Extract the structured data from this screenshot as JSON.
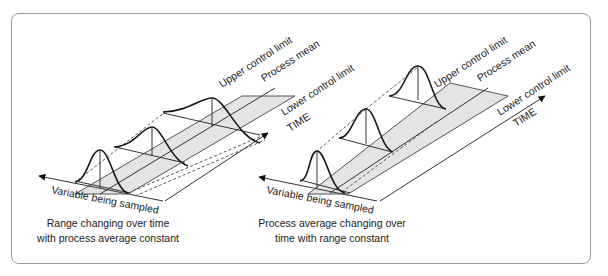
{
  "figure": {
    "left_panel": {
      "labels": {
        "upper": "Upper control limit",
        "mean": "Process mean",
        "lower": "Lower control limit",
        "time": "TIME",
        "variable": "Variable being sampled"
      },
      "caption_line1": "Range changing over time",
      "caption_line2": "with process average constant"
    },
    "right_panel": {
      "labels": {
        "upper": "Upper control limit",
        "mean": "Process mean",
        "lower": "Lower control limit",
        "time": "TIME",
        "variable": "Variable being sampled"
      },
      "caption_line1": "Process average changing over",
      "caption_line2": "time with range constant"
    },
    "colors": {
      "band_fill": "#e4e4e4",
      "frame_border": "#9a9a9a",
      "ink": "#222222"
    }
  }
}
